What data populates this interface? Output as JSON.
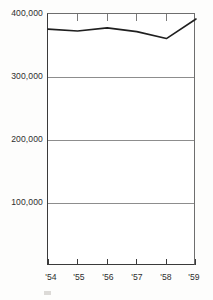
{
  "chart_data": {
    "type": "line",
    "title": "",
    "subtitle": "",
    "xlabel": "",
    "ylabel": "",
    "x": [
      "'54",
      "'55",
      "'56",
      "'57",
      "'58",
      "'59"
    ],
    "categories": [
      "'54",
      "'55",
      "'56",
      "'57",
      "'58",
      "'59"
    ],
    "values": [
      376000,
      373000,
      378000,
      372000,
      361000,
      392000
    ],
    "series": [
      {
        "name": "",
        "values": [
          376000,
          373000,
          378000,
          372000,
          361000,
          392000
        ]
      }
    ],
    "ylim": [
      0,
      400000
    ],
    "xlim": [
      "'54",
      "'59"
    ],
    "y_ticks": [
      100000,
      200000,
      300000,
      400000
    ],
    "y_tick_labels": [
      "100,000",
      "200,000",
      "300,000",
      "400,000"
    ],
    "x_tick_labels": [
      "'54",
      "'55",
      "'56",
      "'57",
      "'58",
      "'59"
    ],
    "grid": true,
    "grid_axis": "y",
    "legend": false,
    "legend_position": "none",
    "line_color": "#1f1f1f",
    "grid_color": "#8d8d8d",
    "axis_color": "#3a3a3a",
    "background_color": "#ffffff"
  },
  "axis": {
    "y_labels": [
      {
        "text": "400,000",
        "value": 400000
      },
      {
        "text": "300,000",
        "value": 300000
      },
      {
        "text": "200,000",
        "value": 200000
      },
      {
        "text": "100,000",
        "value": 100000
      }
    ],
    "x_labels": [
      {
        "text": "'54",
        "value": 1954
      },
      {
        "text": "'55",
        "value": 1955
      },
      {
        "text": "'56",
        "value": 1956
      },
      {
        "text": "'57",
        "value": 1957
      },
      {
        "text": "'58",
        "value": 1958
      },
      {
        "text": "'59",
        "value": 1959
      }
    ]
  }
}
